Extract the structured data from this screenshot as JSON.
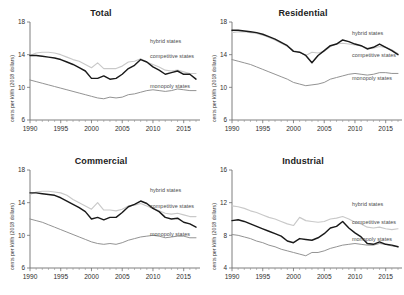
{
  "figure": {
    "ylabel": "cents per kWh (2018 dollars)",
    "series_names": {
      "hybrid": "hybrid states",
      "competitive": "competitive states",
      "monopoly": "monopoly states"
    },
    "colors": {
      "hybrid": "#c9c9c9",
      "competitive": "#1a1a1a",
      "monopoly": "#8d8d8d",
      "axis": "#707070",
      "text": "#2b2b2b",
      "background": "#ffffff"
    }
  },
  "chart_data": [
    {
      "type": "line",
      "title": "Total",
      "xlabel": "",
      "ylabel": "cents per kWh (2018 dollars)",
      "xlim": [
        1990,
        2017
      ],
      "ylim": [
        6,
        18
      ],
      "xticks": [
        1990,
        1995,
        2000,
        2005,
        2010,
        2015
      ],
      "yticks": [
        6,
        10,
        14,
        18
      ],
      "grid": false,
      "legend": "inline-right",
      "x": [
        1990,
        1991,
        1992,
        1993,
        1994,
        1995,
        1996,
        1997,
        1998,
        1999,
        2000,
        2001,
        2002,
        2003,
        2004,
        2005,
        2006,
        2007,
        2008,
        2009,
        2010,
        2011,
        2012,
        2013,
        2014,
        2015,
        2016,
        2017
      ],
      "series": [
        {
          "name": "hybrid states",
          "values": [
            13.9,
            14.2,
            14.3,
            14.3,
            14.2,
            14.0,
            13.7,
            13.4,
            13.2,
            12.8,
            12.4,
            13.0,
            12.3,
            12.3,
            12.3,
            12.6,
            13.1,
            13.2,
            13.5,
            13.1,
            12.8,
            12.5,
            12.1,
            12.0,
            12.1,
            11.9,
            11.7,
            11.7
          ]
        },
        {
          "name": "competitive states",
          "values": [
            13.9,
            13.9,
            13.8,
            13.7,
            13.6,
            13.4,
            13.1,
            12.8,
            12.4,
            12.0,
            11.1,
            11.1,
            11.4,
            11.0,
            11.1,
            11.6,
            12.3,
            12.7,
            13.4,
            13.1,
            12.5,
            12.1,
            11.6,
            11.8,
            12.0,
            11.6,
            11.6,
            11.0
          ]
        },
        {
          "name": "monopoly states",
          "values": [
            10.9,
            10.7,
            10.5,
            10.3,
            10.1,
            9.9,
            9.7,
            9.5,
            9.3,
            9.1,
            8.9,
            8.7,
            8.6,
            8.8,
            8.7,
            8.8,
            9.1,
            9.2,
            9.4,
            9.6,
            9.7,
            9.6,
            9.5,
            9.6,
            9.8,
            9.7,
            9.6,
            9.6
          ]
        }
      ]
    },
    {
      "type": "line",
      "title": "Residential",
      "xlabel": "",
      "ylabel": "cents per kWh (2018 dollars)",
      "xlim": [
        1990,
        2017
      ],
      "ylim": [
        6,
        18
      ],
      "xticks": [
        1990,
        1995,
        2000,
        2005,
        2010,
        2015
      ],
      "yticks": [
        6,
        10,
        14,
        18
      ],
      "grid": false,
      "legend": "inline-right",
      "x": [
        1990,
        1991,
        1992,
        1993,
        1994,
        1995,
        1996,
        1997,
        1998,
        1999,
        2000,
        2001,
        2002,
        2003,
        2004,
        2005,
        2006,
        2007,
        2008,
        2009,
        2010,
        2011,
        2012,
        2013,
        2014,
        2015,
        2016,
        2017
      ],
      "series": [
        {
          "name": "hybrid states",
          "values": [
            16.7,
            16.8,
            16.8,
            16.7,
            16.6,
            16.4,
            16.1,
            15.8,
            15.4,
            15.0,
            14.5,
            14.3,
            13.9,
            14.3,
            14.2,
            14.4,
            15.0,
            15.3,
            15.4,
            15.3,
            15.2,
            15.1,
            14.8,
            14.8,
            15.0,
            14.9,
            14.6,
            14.1
          ]
        },
        {
          "name": "competitive states",
          "values": [
            17.0,
            17.0,
            16.9,
            16.8,
            16.7,
            16.5,
            16.2,
            15.9,
            15.5,
            15.1,
            14.4,
            14.3,
            13.9,
            13.0,
            13.9,
            14.5,
            15.1,
            15.3,
            15.8,
            15.6,
            15.3,
            15.1,
            14.7,
            14.9,
            15.3,
            14.9,
            14.5,
            14.0
          ]
        },
        {
          "name": "monopoly states",
          "values": [
            13.4,
            13.2,
            13.0,
            12.8,
            12.5,
            12.2,
            11.9,
            11.6,
            11.3,
            11.0,
            10.6,
            10.4,
            10.2,
            10.3,
            10.4,
            10.6,
            11.0,
            11.2,
            11.4,
            11.6,
            11.7,
            11.6,
            11.5,
            11.6,
            11.8,
            11.8,
            11.7,
            11.7
          ]
        }
      ]
    },
    {
      "type": "line",
      "title": "Commercial",
      "xlabel": "",
      "ylabel": "cents per kWh (2018 dollars)",
      "xlim": [
        1990,
        2017
      ],
      "ylim": [
        6,
        18
      ],
      "xticks": [
        1990,
        1995,
        2000,
        2005,
        2010,
        2015
      ],
      "yticks": [
        6,
        10,
        14,
        18
      ],
      "grid": false,
      "legend": "inline-right",
      "x": [
        1990,
        1991,
        1992,
        1993,
        1994,
        1995,
        1996,
        1997,
        1998,
        1999,
        2000,
        2001,
        2002,
        2003,
        2004,
        2005,
        2006,
        2007,
        2008,
        2009,
        2010,
        2011,
        2012,
        2013,
        2014,
        2015,
        2016,
        2017
      ],
      "series": [
        {
          "name": "hybrid states",
          "values": [
            15.0,
            15.3,
            15.4,
            15.4,
            15.3,
            15.2,
            14.9,
            14.4,
            14.0,
            13.6,
            13.2,
            14.0,
            13.1,
            13.1,
            13.0,
            13.2,
            13.6,
            13.7,
            13.9,
            13.6,
            13.3,
            13.0,
            12.7,
            12.6,
            12.7,
            12.5,
            12.3,
            12.3
          ]
        },
        {
          "name": "competitive states",
          "values": [
            15.2,
            15.2,
            15.1,
            15.0,
            14.9,
            14.6,
            14.2,
            13.8,
            13.4,
            12.9,
            12.0,
            12.2,
            11.9,
            12.2,
            12.2,
            12.8,
            13.5,
            13.8,
            14.2,
            13.9,
            13.3,
            12.9,
            12.2,
            12.0,
            12.1,
            11.6,
            11.4,
            11.0
          ]
        },
        {
          "name": "monopoly states",
          "values": [
            12.0,
            11.8,
            11.6,
            11.3,
            11.0,
            10.7,
            10.4,
            10.1,
            9.8,
            9.5,
            9.2,
            9.0,
            8.9,
            9.0,
            8.9,
            9.1,
            9.4,
            9.6,
            9.8,
            9.9,
            10.0,
            9.9,
            9.7,
            9.8,
            9.9,
            9.9,
            9.7,
            9.7
          ]
        }
      ]
    },
    {
      "type": "line",
      "title": "Industrial",
      "xlabel": "",
      "ylabel": "cents per kWh (2018 dollars)",
      "xlim": [
        1990,
        2017
      ],
      "ylim": [
        4,
        16
      ],
      "xticks": [
        1990,
        1995,
        2000,
        2005,
        2010,
        2015
      ],
      "yticks": [
        4,
        8,
        12,
        16
      ],
      "grid": false,
      "legend": "inline-right",
      "x": [
        1990,
        1991,
        1992,
        1993,
        1994,
        1995,
        1996,
        1997,
        1998,
        1999,
        2000,
        2001,
        2002,
        2003,
        2004,
        2005,
        2006,
        2007,
        2008,
        2009,
        2010,
        2011,
        2012,
        2013,
        2014,
        2015,
        2016,
        2017
      ],
      "series": [
        {
          "name": "hybrid states",
          "values": [
            11.6,
            11.5,
            11.3,
            11.0,
            10.8,
            10.5,
            10.2,
            10.0,
            9.7,
            9.4,
            9.2,
            10.2,
            9.8,
            9.7,
            9.6,
            9.7,
            10.0,
            10.1,
            10.3,
            10.0,
            9.6,
            9.4,
            9.0,
            8.9,
            9.0,
            8.8,
            8.7,
            8.8
          ]
        },
        {
          "name": "competitive states",
          "values": [
            9.8,
            9.9,
            9.7,
            9.4,
            9.1,
            8.8,
            8.5,
            8.2,
            7.9,
            7.3,
            7.1,
            7.6,
            7.5,
            7.4,
            7.7,
            8.2,
            8.9,
            9.1,
            9.7,
            8.9,
            8.3,
            7.8,
            7.0,
            6.9,
            7.2,
            6.9,
            6.8,
            6.6
          ]
        },
        {
          "name": "monopoly states",
          "values": [
            8.1,
            8.0,
            7.8,
            7.6,
            7.3,
            7.1,
            6.8,
            6.6,
            6.3,
            6.1,
            5.9,
            5.7,
            5.5,
            5.9,
            5.9,
            6.1,
            6.4,
            6.6,
            6.8,
            6.9,
            7.0,
            6.9,
            6.8,
            6.8,
            7.0,
            6.9,
            6.7,
            6.6
          ]
        }
      ]
    }
  ]
}
